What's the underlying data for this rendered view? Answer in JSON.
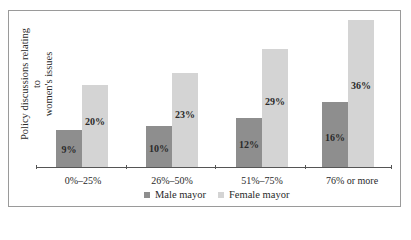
{
  "chart_data": {
    "type": "bar",
    "title": "",
    "xlabel": "",
    "ylabel": "Policy discussions relating to women's issues",
    "categories": [
      "0%–25%",
      "26%–50%",
      "51%–75%",
      "76% or more"
    ],
    "series": [
      {
        "name": "Male mayor",
        "values": [
          9,
          10,
          12,
          16
        ],
        "labels": [
          "9%",
          "10%",
          "12%",
          "16%"
        ],
        "color": "#8e8e8e"
      },
      {
        "name": "Female mayor",
        "values": [
          20,
          23,
          29,
          36
        ],
        "labels": [
          "20%",
          "23%",
          "29%",
          "36%"
        ],
        "color": "#d4d4d4"
      }
    ],
    "ylim": [
      0,
      40
    ],
    "grid": false,
    "legend_position": "bottom",
    "value_labels": true
  },
  "ylabel_line1": "Policy discussions relating to",
  "ylabel_line2": "women's issues"
}
